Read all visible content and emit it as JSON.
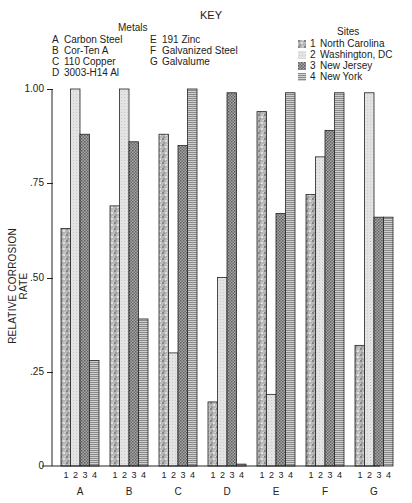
{
  "key": {
    "title": "KEY",
    "metals_title": "Metals",
    "metals": [
      {
        "code": "A",
        "name": "Carbon Steel"
      },
      {
        "code": "B",
        "name": "Cor-Ten A"
      },
      {
        "code": "C",
        "name": "110 Copper"
      },
      {
        "code": "D",
        "name": "3003-H14 Al"
      },
      {
        "code": "E",
        "name": "191 Zinc"
      },
      {
        "code": "F",
        "name": "Galvanized Steel"
      },
      {
        "code": "G",
        "name": "Galvalume"
      }
    ],
    "sites_title": "Sites",
    "sites": [
      {
        "num": "1",
        "name": "North Carolina",
        "pattern": "speckled"
      },
      {
        "num": "2",
        "name": "Washington, DC",
        "pattern": "light-dotted"
      },
      {
        "num": "3",
        "name": "New Jersey",
        "pattern": "crosshatch"
      },
      {
        "num": "4",
        "name": "New York",
        "pattern": "horizontal-lines"
      }
    ]
  },
  "axis": {
    "ylabel": "RELATIVE CORROSION RATE",
    "yticks": [
      {
        "value": 1.0,
        "label": "1.00"
      },
      {
        "value": 0.75,
        "label": ".75"
      },
      {
        "value": 0.5,
        "label": ".50"
      },
      {
        "value": 0.25,
        "label": ".25"
      },
      {
        "value": 0,
        "label": "0"
      }
    ]
  },
  "chart_data": {
    "type": "bar",
    "title": "KEY",
    "xlabel": "",
    "ylabel": "RELATIVE CORROSION RATE",
    "ylim": [
      0,
      1.0
    ],
    "grid": false,
    "legend_position": "top",
    "categories": [
      "A",
      "B",
      "C",
      "D",
      "E",
      "F",
      "G"
    ],
    "category_names": [
      "Carbon Steel",
      "Cor-Ten A",
      "110 Copper",
      "3003-H14 Al",
      "191 Zinc",
      "Galvanized Steel",
      "Galvalume"
    ],
    "sub_labels": [
      "1",
      "2",
      "3",
      "4"
    ],
    "series": [
      {
        "name": "1 North Carolina",
        "values": [
          0.63,
          0.69,
          0.88,
          0.17,
          0.94,
          0.72,
          0.32
        ]
      },
      {
        "name": "2 Washington, DC",
        "values": [
          1.0,
          1.0,
          0.3,
          0.5,
          0.19,
          0.82,
          0.99
        ]
      },
      {
        "name": "3 New Jersey",
        "values": [
          0.88,
          0.86,
          0.85,
          0.99,
          0.67,
          0.89,
          0.66
        ]
      },
      {
        "name": "4 New York",
        "values": [
          0.28,
          0.39,
          1.0,
          0.005,
          0.99,
          0.99,
          0.66
        ]
      }
    ]
  }
}
